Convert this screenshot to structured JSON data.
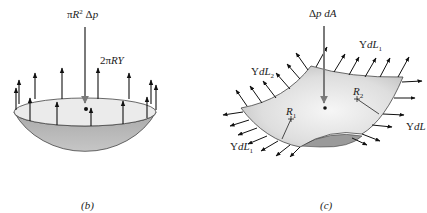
{
  "figure_b": {
    "caption": "(b)",
    "load_label": "πR² Δp",
    "load_label_parts": {
      "prefix": "π",
      "R": "R",
      "sup": "2",
      "delta": " Δ",
      "p": "p"
    },
    "tension_label": "2πRY",
    "tension_parts": {
      "prefix": "2π",
      "RY": "RY"
    },
    "colors": {
      "shell": "#b4b4b4",
      "rim": "#ebebeb",
      "arrow": "#111111",
      "load_arrow": "#7a7a7a"
    }
  },
  "figure_c": {
    "caption": "(c)",
    "load_label": "Δp dA",
    "load_parts": {
      "delta": "Δ",
      "p": "p",
      "dA": " dA"
    },
    "edge_labels": {
      "top_right": {
        "Y": "Y",
        "dL": "dL",
        "sub": "1"
      },
      "top_left": {
        "Y": "Y",
        "dL": "dL",
        "sub": "2"
      },
      "right": {
        "Y": "Y",
        "dL": "dL",
        "sub": ""
      },
      "bottom_left": {
        "Y": "Y",
        "dL": "dL",
        "sub": "1"
      }
    },
    "radius_labels": {
      "r1": {
        "R": "R",
        "sub": "1"
      },
      "r2": {
        "R": "R",
        "sub": "2"
      }
    },
    "colors": {
      "surface_light": "#ececec",
      "surface_dark": "#9a9a9a",
      "arrow": "#111111",
      "load_arrow": "#7a7a7a"
    }
  }
}
